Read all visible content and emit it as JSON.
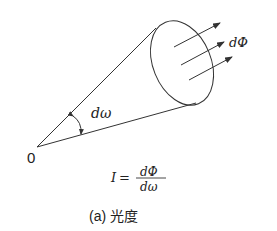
{
  "diagram": {
    "type": "luminous-intensity-cone",
    "origin_label": "0",
    "solid_angle_label": "dω",
    "flux_label": "dΦ",
    "formula": {
      "lhs": "I",
      "equals": "=",
      "numerator": "dΦ",
      "denominator": "dω"
    },
    "caption": "(a) 光度",
    "colors": {
      "line": "#333333",
      "text": "#222222",
      "background": "#ffffff"
    }
  }
}
